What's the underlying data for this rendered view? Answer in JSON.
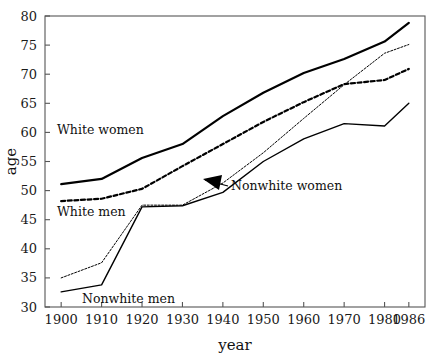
{
  "chart_data": {
    "type": "line",
    "title": "",
    "xlabel": "year",
    "ylabel": "age",
    "xlim": [
      1896,
      1990
    ],
    "ylim": [
      30,
      80
    ],
    "grid": false,
    "legend_position": "in-plot labels with arrow annotation",
    "x": [
      1900,
      1910,
      1920,
      1930,
      1940,
      1950,
      1960,
      1970,
      1980,
      1986
    ],
    "x_tick_labels": [
      "1900",
      "1910",
      "1920",
      "1930",
      "1940",
      "1950",
      "1960",
      "1970",
      "1980",
      "1986"
    ],
    "y_tick_labels": [
      "30",
      "35",
      "40",
      "45",
      "50",
      "55",
      "60",
      "65",
      "70",
      "75",
      "80"
    ],
    "y_ticks": [
      30,
      35,
      40,
      45,
      50,
      55,
      60,
      65,
      70,
      75,
      80
    ],
    "series": [
      {
        "name": "White women",
        "style": "thick-solid",
        "values": [
          51.1,
          52.0,
          55.6,
          58.0,
          62.8,
          66.8,
          70.2,
          72.6,
          75.6,
          78.8
        ]
      },
      {
        "name": "White men",
        "style": "thick-dashed",
        "values": [
          48.2,
          48.6,
          50.3,
          54.2,
          58.0,
          61.8,
          65.2,
          68.3,
          69.0,
          70.9
        ]
      },
      {
        "name": "Nonwhite women",
        "style": "thin-dotted",
        "values": [
          35.0,
          37.6,
          47.5,
          47.5,
          51.3,
          56.5,
          62.4,
          68.2,
          73.6,
          75.1
        ]
      },
      {
        "name": "Nonwhite men",
        "style": "thin-solid",
        "values": [
          32.6,
          33.8,
          47.2,
          47.4,
          49.7,
          55.0,
          58.9,
          61.5,
          61.1,
          65.0
        ]
      }
    ],
    "annotations": [
      {
        "text": "White women",
        "kind": "inline-label"
      },
      {
        "text": "White men",
        "kind": "inline-label"
      },
      {
        "text": "Nonwhite men",
        "kind": "inline-label"
      },
      {
        "text": "Nonwhite women",
        "kind": "arrow-label"
      }
    ]
  }
}
